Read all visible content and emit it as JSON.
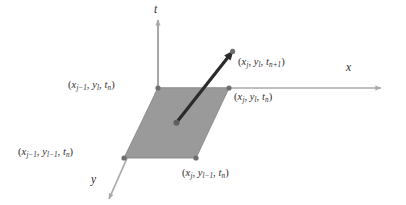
{
  "figure": {
    "type": "3d-stencil-diagram",
    "background_color": "#ffffff",
    "axes": [
      {
        "name": "t-axis",
        "label": "t",
        "orientation": "vertical-up",
        "x": 158,
        "y_from": 88,
        "y_to": 18,
        "label_x": 155,
        "label_y": 6
      },
      {
        "name": "x-axis",
        "label": "x",
        "orientation": "horizontal-right",
        "y": 88,
        "x_from": 158,
        "x_to": 383,
        "label_x": 347,
        "label_y": 63
      },
      {
        "name": "y-axis",
        "label": "y",
        "orientation": "diagonal-down-left",
        "x_from": 158,
        "y_from": 88,
        "x_to": 108,
        "y_to": 201,
        "label_x": 92,
        "label_y": 175
      }
    ],
    "axis_color": "#a8a8a8",
    "cell": {
      "name": "stencil-face",
      "fill_color": "#9a9a9a",
      "stroke_color": "#8a8a8a",
      "vertices": [
        {
          "x": 158,
          "y": 88
        },
        {
          "x": 229,
          "y": 88
        },
        {
          "x": 196,
          "y": 158
        },
        {
          "x": 124,
          "y": 158
        }
      ]
    },
    "vertex_dot_color": "#6f6f6f",
    "arrow": {
      "name": "time-step-arrow",
      "color": "#2b2b2b",
      "from": {
        "x": 176,
        "y": 123
      },
      "to": {
        "x": 233,
        "y": 51
      },
      "width": 3.2
    },
    "point_labels": [
      {
        "id": "top-right-future",
        "anchor": "arrow-tip",
        "x": 238,
        "y": 57,
        "parts": [
          {
            "t": "(",
            "k": "paren"
          },
          {
            "t": "x",
            "k": "var"
          },
          {
            "t": "j",
            "k": "sub"
          },
          {
            "t": ", ",
            "k": "comma"
          },
          {
            "t": "y",
            "k": "var"
          },
          {
            "t": "l",
            "k": "sub"
          },
          {
            "t": ", ",
            "k": "comma"
          },
          {
            "t": "t",
            "k": "var"
          },
          {
            "t": "n+1",
            "k": "sub"
          },
          {
            "t": ")",
            "k": "paren"
          }
        ]
      },
      {
        "id": "top-left-corner",
        "anchor": "vertex-top-left",
        "x": 68,
        "y": 80,
        "parts": [
          {
            "t": "(",
            "k": "paren"
          },
          {
            "t": "x",
            "k": "var"
          },
          {
            "t": "j−1",
            "k": "sub"
          },
          {
            "t": ", ",
            "k": "comma"
          },
          {
            "t": "y",
            "k": "var"
          },
          {
            "t": "l",
            "k": "sub"
          },
          {
            "t": ", ",
            "k": "comma"
          },
          {
            "t": "t",
            "k": "var"
          },
          {
            "t": "n",
            "k": "sub"
          },
          {
            "t": ")",
            "k": "paren"
          }
        ]
      },
      {
        "id": "top-right-corner",
        "anchor": "vertex-top-right",
        "x": 234,
        "y": 92,
        "parts": [
          {
            "t": "(",
            "k": "paren"
          },
          {
            "t": "x",
            "k": "var"
          },
          {
            "t": "j",
            "k": "sub"
          },
          {
            "t": ", ",
            "k": "comma"
          },
          {
            "t": "y",
            "k": "var"
          },
          {
            "t": "l",
            "k": "sub"
          },
          {
            "t": ", ",
            "k": "comma"
          },
          {
            "t": "t",
            "k": "var"
          },
          {
            "t": "n",
            "k": "sub"
          },
          {
            "t": ")",
            "k": "paren"
          }
        ]
      },
      {
        "id": "bottom-left-corner",
        "anchor": "vertex-bottom-left",
        "x": 18,
        "y": 147,
        "parts": [
          {
            "t": "(",
            "k": "paren"
          },
          {
            "t": "x",
            "k": "var"
          },
          {
            "t": "j−1",
            "k": "sub"
          },
          {
            "t": ", ",
            "k": "comma"
          },
          {
            "t": "y",
            "k": "var"
          },
          {
            "t": "l−1",
            "k": "sub"
          },
          {
            "t": ", ",
            "k": "comma"
          },
          {
            "t": "t",
            "k": "var"
          },
          {
            "t": "n",
            "k": "sub"
          },
          {
            "t": ")",
            "k": "paren"
          }
        ]
      },
      {
        "id": "bottom-right-corner",
        "anchor": "vertex-bottom-right",
        "x": 182,
        "y": 168,
        "parts": [
          {
            "t": "(",
            "k": "paren"
          },
          {
            "t": "x",
            "k": "var"
          },
          {
            "t": "j",
            "k": "sub"
          },
          {
            "t": ", ",
            "k": "comma"
          },
          {
            "t": "y",
            "k": "var"
          },
          {
            "t": "l−1",
            "k": "sub"
          },
          {
            "t": ", ",
            "k": "comma"
          },
          {
            "t": "t",
            "k": "var"
          },
          {
            "t": "n",
            "k": "sub"
          },
          {
            "t": ")",
            "k": "paren"
          }
        ]
      }
    ]
  }
}
